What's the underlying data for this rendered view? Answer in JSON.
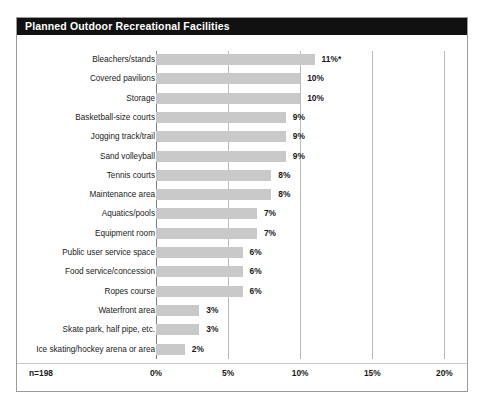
{
  "card": {
    "title": "Planned Outdoor Recreational Facilities"
  },
  "footer": {
    "sample_size": "n=198"
  },
  "colors": {
    "title_bar_bg": "#111111",
    "title_text": "#ffffff",
    "bar_fill": "#c9c9c9",
    "gridline": "#b9b9b9",
    "axis_line": "#7d7d7d",
    "card_border": "#9a9a9a",
    "text": "#1a1a1a",
    "page_bg": "#ffffff"
  },
  "chart_data": {
    "type": "bar",
    "orientation": "horizontal",
    "title": "Planned Outdoor Recreational Facilities",
    "xlabel": "",
    "ylabel": "",
    "xlim": [
      0,
      22
    ],
    "grid": true,
    "legend": false,
    "note": "n=198",
    "categories": [
      "Bleachers/stands",
      "Covered pavilions",
      "Storage",
      "Basketball-size courts",
      "Jogging track/trail",
      "Sand volleyball",
      "Tennis courts",
      "Maintenance area",
      "Aquatics/pools",
      "Equipment room",
      "Public user service space",
      "Food service/concession",
      "Ropes course",
      "Waterfront area",
      "Skate park, half pipe, etc.",
      "Ice skating/hockey arena or area"
    ],
    "values": [
      11,
      10,
      10,
      9,
      9,
      9,
      8,
      8,
      7,
      7,
      6,
      6,
      6,
      3,
      3,
      2
    ],
    "value_labels": [
      "11%*",
      "10%",
      "10%",
      "9%",
      "9%",
      "9%",
      "8%",
      "8%",
      "7%",
      "7%",
      "6%",
      "6%",
      "6%",
      "3%",
      "3%",
      "2%"
    ],
    "xticks": [
      0,
      5,
      10,
      15,
      20
    ],
    "xtick_labels": [
      "0%",
      "5%",
      "10%",
      "15%",
      "20%"
    ]
  }
}
